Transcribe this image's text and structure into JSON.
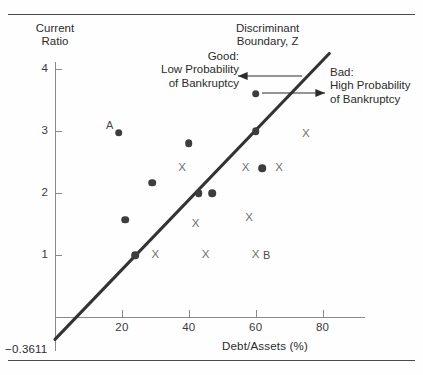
{
  "chart_data": {
    "type": "scatter",
    "title": "",
    "xlabel": "Debt/Assets (%)",
    "ylabel": "Current Ratio",
    "xlim": [
      -4,
      92
    ],
    "ylim": [
      -0.55,
      4.35
    ],
    "xticks": [
      20,
      40,
      60,
      80
    ],
    "yticks": [
      1,
      2,
      3,
      4
    ],
    "grid": false,
    "legend_position": "none",
    "y_axis_intercept_label": "−0.3611",
    "series": [
      {
        "name": "Good: Low Probability of Bankruptcy",
        "marker": "filled-circle",
        "color": "#3d3d3d",
        "points": [
          {
            "x": 19,
            "y": 2.97,
            "label": "A"
          },
          {
            "x": 29,
            "y": 2.17,
            "label": ""
          },
          {
            "x": 21,
            "y": 1.57,
            "label": ""
          },
          {
            "x": 24,
            "y": 1.0,
            "label": ""
          },
          {
            "x": 40,
            "y": 2.8,
            "label": ""
          },
          {
            "x": 43,
            "y": 2.0,
            "label": ""
          },
          {
            "x": 47,
            "y": 2.0,
            "label": ""
          },
          {
            "x": 60,
            "y": 3.6,
            "label": ""
          },
          {
            "x": 60,
            "y": 3.0,
            "label": ""
          },
          {
            "x": 62,
            "y": 2.4,
            "label": ""
          }
        ]
      },
      {
        "name": "Bad: High Probability of Bankruptcy",
        "marker": "x",
        "color": "#6e6e6e",
        "points": [
          {
            "x": 30,
            "y": 1.0,
            "label": ""
          },
          {
            "x": 38,
            "y": 2.4,
            "label": ""
          },
          {
            "x": 42,
            "y": 1.5,
            "label": ""
          },
          {
            "x": 45,
            "y": 1.0,
            "label": ""
          },
          {
            "x": 57,
            "y": 2.4,
            "label": ""
          },
          {
            "x": 58,
            "y": 1.6,
            "label": ""
          },
          {
            "x": 67,
            "y": 2.4,
            "label": ""
          },
          {
            "x": 75,
            "y": 2.95,
            "label": ""
          },
          {
            "x": 60,
            "y": 1.0,
            "label": "B"
          }
        ]
      }
    ],
    "reference_line": {
      "name": "Discriminant Boundary, Z",
      "x_start": 0,
      "y_start": -0.3611,
      "x_end": 82,
      "y_end": 4.25,
      "color": "#333333"
    },
    "annotations": [
      {
        "id": "boundary",
        "text_lines": [
          "Discriminant",
          "Boundary, Z"
        ]
      },
      {
        "id": "good",
        "text_lines": [
          "Good:",
          "Low Probability",
          "of Bankruptcy"
        ],
        "arrow": "left"
      },
      {
        "id": "bad",
        "text_lines": [
          "Bad:",
          "High Probability",
          "of Bankruptcy"
        ],
        "arrow": "right"
      }
    ]
  }
}
